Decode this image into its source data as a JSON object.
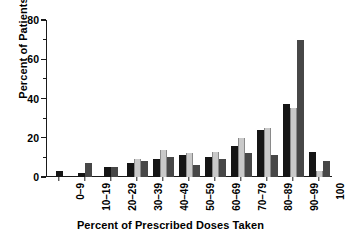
{
  "chart_data": {
    "type": "bar",
    "title": "",
    "xlabel": "Percent of Prescribed Doses Taken",
    "ylabel": "Percent of Patients",
    "categories": [
      "0–9",
      "10–19",
      "20–29",
      "30–39",
      "40–49",
      "50–59",
      "60–69",
      "70–79",
      "80–89",
      "90–99",
      "100"
    ],
    "series": [
      {
        "name": "series-1",
        "color": "#151515",
        "values": [
          3,
          2,
          5,
          7,
          9,
          11,
          10,
          16,
          24,
          37,
          13
        ]
      },
      {
        "name": "series-2",
        "color": "#c9c9c9",
        "values": [
          0,
          0,
          0,
          9,
          14,
          12,
          13,
          20,
          25,
          35,
          3
        ]
      },
      {
        "name": "series-3",
        "color": "#474747",
        "values": [
          0,
          7,
          5,
          8,
          10,
          6,
          9,
          12,
          11,
          70,
          8
        ]
      }
    ],
    "ylim": [
      0,
      80
    ],
    "ytick_labels": [
      "0",
      "20",
      "40",
      "60",
      "80"
    ],
    "ytick_values": [
      0,
      20,
      40,
      60,
      80
    ],
    "yminor_values": [
      10,
      30,
      50,
      70
    ],
    "grid": false,
    "legend": "none"
  }
}
